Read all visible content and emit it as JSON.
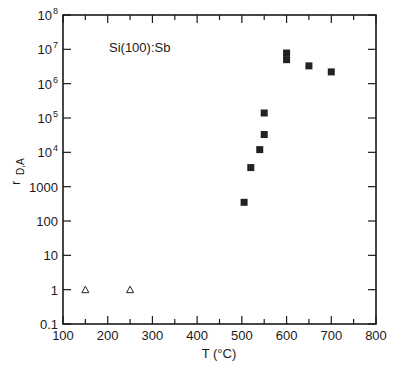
{
  "chart_data": {
    "type": "scatter",
    "title": "",
    "annotation": "Si(100):Sb",
    "xlabel": "T (°C)",
    "ylabel": "r",
    "ylabel_subscript": "D,A",
    "xlim": [
      100,
      800
    ],
    "ylim": [
      0.1,
      100000000
    ],
    "yscale": "log",
    "grid": false,
    "legend": null,
    "x_ticks": [
      100,
      200,
      300,
      400,
      500,
      600,
      700,
      800
    ],
    "x_tick_labels": [
      "100",
      "200",
      "300",
      "400",
      "500",
      "600",
      "700",
      "800"
    ],
    "x_minor_ticks": [
      150,
      250,
      350,
      450,
      550,
      650,
      750
    ],
    "y_ticks": [
      0.1,
      1,
      10,
      100,
      1000,
      10000,
      100000,
      1000000,
      10000000,
      100000000
    ],
    "y_tick_labels": [
      {
        "base": "0.1",
        "exp": ""
      },
      {
        "base": "1",
        "exp": ""
      },
      {
        "base": "10",
        "exp": ""
      },
      {
        "base": "100",
        "exp": ""
      },
      {
        "base": "1000",
        "exp": ""
      },
      {
        "base": "10",
        "exp": "4"
      },
      {
        "base": "10",
        "exp": "5"
      },
      {
        "base": "10",
        "exp": "6"
      },
      {
        "base": "10",
        "exp": "7"
      },
      {
        "base": "10",
        "exp": "8"
      }
    ],
    "series": [
      {
        "name": "filled squares",
        "marker": "square-filled",
        "color": "#222222",
        "x": [
          505,
          520,
          540,
          550,
          550,
          600,
          600,
          650,
          700
        ],
        "y": [
          350,
          3600,
          12000,
          33000,
          140000,
          5000000,
          7800000,
          3300000,
          2200000
        ]
      },
      {
        "name": "open triangles",
        "marker": "triangle-open",
        "color": "#222222",
        "x": [
          150,
          250
        ],
        "y": [
          1,
          1
        ]
      }
    ]
  }
}
